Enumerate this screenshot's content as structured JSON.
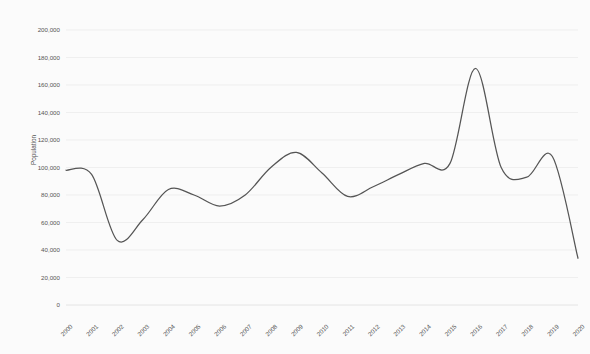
{
  "chart_data": {
    "type": "line",
    "title": "",
    "xlabel": "",
    "ylabel": "Population",
    "x": [
      2000,
      2001,
      2002,
      2003,
      2004,
      2005,
      2006,
      2007,
      2008,
      2009,
      2010,
      2011,
      2012,
      2013,
      2014,
      2015,
      2016,
      2017,
      2018,
      2019,
      2020
    ],
    "categories": [
      "2000",
      "2001",
      "2002",
      "2003",
      "2004",
      "2005",
      "2006",
      "2007",
      "2008",
      "2009",
      "2010",
      "2011",
      "2012",
      "2013",
      "2014",
      "2015",
      "2016",
      "2017",
      "2018",
      "2019",
      "2020"
    ],
    "values": [
      98000,
      95000,
      47000,
      62000,
      84000,
      80000,
      72000,
      80000,
      100000,
      111000,
      96000,
      79000,
      86000,
      95000,
      103000,
      103000,
      172000,
      100000,
      93000,
      108000,
      34000
    ],
    "series": [
      {
        "name": "Population",
        "values": [
          98000,
          95000,
          47000,
          62000,
          84000,
          80000,
          72000,
          80000,
          100000,
          111000,
          96000,
          79000,
          86000,
          95000,
          103000,
          103000,
          172000,
          100000,
          93000,
          108000,
          34000
        ]
      }
    ],
    "ylim": [
      0,
      200000
    ],
    "ytick_step": 20000,
    "ytick_labels": [
      "0",
      "20,000",
      "40,000",
      "60,000",
      "80,000",
      "100,000",
      "120,000",
      "140,000",
      "160,000",
      "180,000",
      "200,000"
    ],
    "ytick_values": [
      0,
      20000,
      40000,
      60000,
      80000,
      100000,
      120000,
      140000,
      160000,
      180000,
      200000
    ],
    "xtick_labels": [
      "2000",
      "2001",
      "2002",
      "2003",
      "2004",
      "2005",
      "2006",
      "2007",
      "2008",
      "2009",
      "2010",
      "2011",
      "2012",
      "2013",
      "2014",
      "2015",
      "2016",
      "2017",
      "2018",
      "2019",
      "2020"
    ],
    "grid": true,
    "grid_axis": "y",
    "legend": false,
    "legend_position": "none",
    "interpolation": "smooth-spline",
    "line_color": "#555555",
    "grid_color": "#e9e9e9",
    "background_color": "#fbfbfb",
    "text_color": "#555555",
    "xtick_label_rotation": -45
  }
}
